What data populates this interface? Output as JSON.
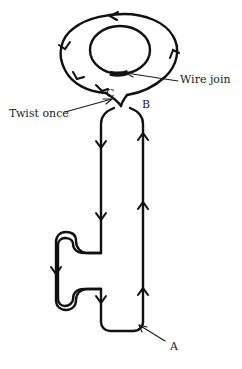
{
  "figure": {
    "background_color": "#ffffff",
    "stroke_color": "#111111",
    "width": 242,
    "height": 369,
    "labels": {
      "twist_once": "Twist once",
      "wire_join": "Wire join",
      "point_c": "C",
      "point_b": "B",
      "point_a": "A"
    },
    "icons": {
      "flow_arrow": "chevron-arrow-icon",
      "pointer_twist": "leader-arrow-icon",
      "pointer_join": "leader-arrow-icon",
      "pointer_a": "leader-arrow-icon"
    },
    "parts": {
      "outer_loop": "outer-loop-path",
      "inner_loop": "inner-loop-path",
      "wire_join_segment": "wire-join-thick-segment",
      "shaft_left": "shaft-left-wire",
      "shaft_right": "shaft-right-wire",
      "key_bit": "key-bit-ward-wire"
    },
    "flow_direction": {
      "outer_loop": "counter-clockwise",
      "left_wire": "downward",
      "right_wire": "upward"
    }
  }
}
